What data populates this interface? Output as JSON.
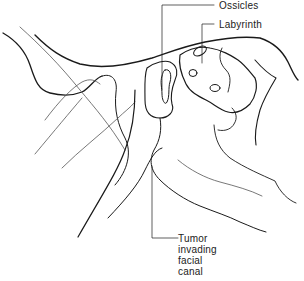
{
  "diagram": {
    "labels": [
      {
        "id": "ossicles",
        "text": "Ossicles"
      },
      {
        "id": "labyrinth",
        "text": "Labyrinth"
      },
      {
        "id": "tumor",
        "lines": [
          "Tumor",
          "invading",
          "facial",
          "canal"
        ]
      }
    ],
    "colors": {
      "ink": "#1a1a1a",
      "thin": "#555555",
      "background": "#ffffff"
    }
  }
}
